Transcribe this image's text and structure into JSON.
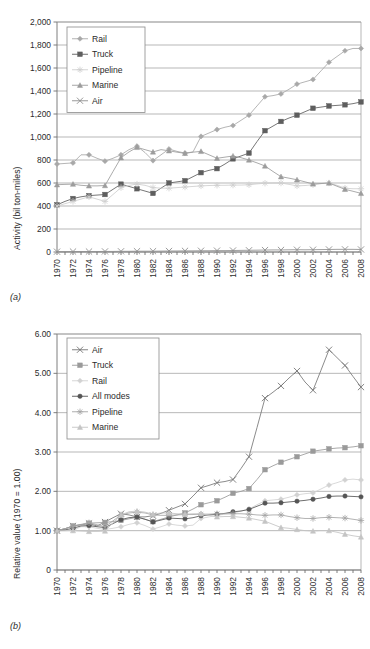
{
  "figure": {
    "panel_a_tag": "(a)",
    "panel_b_tag": "(b)"
  },
  "chart_data": [
    {
      "id": "panel-a",
      "type": "line",
      "title": "",
      "xlabel": "",
      "ylabel": "Activity (bil ton-miles)",
      "panel_label": "(a)",
      "grid": true,
      "legend_position": "top-left",
      "xlim": [
        1970,
        2008
      ],
      "ylim": [
        0,
        2000
      ],
      "yticks": [
        "0",
        "200",
        "400",
        "600",
        "800",
        "1,000",
        "1,200",
        "1,400",
        "1,600",
        "1,800",
        "2,000"
      ],
      "ytick_values": [
        0,
        200,
        400,
        600,
        800,
        1000,
        1200,
        1400,
        1600,
        1800,
        2000
      ],
      "x": [
        1970,
        1971,
        1972,
        1973,
        1974,
        1975,
        1976,
        1977,
        1978,
        1979,
        1980,
        1981,
        1982,
        1983,
        1984,
        1985,
        1986,
        1987,
        1988,
        1989,
        1990,
        1991,
        1992,
        1993,
        1994,
        1995,
        1996,
        1997,
        1998,
        1999,
        2000,
        2001,
        2002,
        2003,
        2004,
        2005,
        2006,
        2007,
        2008
      ],
      "categories": [
        "1970",
        "1972",
        "1974",
        "1976",
        "1978",
        "1980",
        "1982",
        "1984",
        "1986",
        "1988",
        "1990",
        "1992",
        "1994",
        "1996",
        "1998",
        "2000",
        "2002",
        "2004",
        "2006",
        "2008"
      ],
      "series": [
        {
          "name": "Rail",
          "marker": "diamond",
          "color": "#a8a8a8",
          "values": [
            765,
            770,
            775,
            845,
            845,
            815,
            790,
            815,
            845,
            890,
            920,
            865,
            795,
            845,
            895,
            875,
            860,
            870,
            1005,
            1035,
            1065,
            1085,
            1100,
            1145,
            1190,
            1270,
            1350,
            1360,
            1375,
            1415,
            1460,
            1480,
            1500,
            1575,
            1650,
            1700,
            1750,
            1770,
            1770
          ]
        },
        {
          "name": "Truck",
          "marker": "square",
          "color": "#5e5e5e",
          "values": [
            410,
            440,
            465,
            480,
            490,
            495,
            500,
            545,
            590,
            570,
            550,
            530,
            510,
            555,
            600,
            610,
            620,
            655,
            690,
            710,
            725,
            765,
            810,
            835,
            860,
            960,
            1055,
            1095,
            1135,
            1165,
            1190,
            1220,
            1250,
            1260,
            1270,
            1275,
            1280,
            1290,
            1305
          ]
        },
        {
          "name": "Pipeline",
          "marker": "asterisk",
          "color": "#cfcfcf",
          "values": [
            400,
            420,
            440,
            460,
            480,
            460,
            440,
            500,
            560,
            580,
            590,
            580,
            560,
            555,
            555,
            560,
            565,
            570,
            575,
            578,
            580,
            580,
            582,
            582,
            585,
            592,
            598,
            600,
            600,
            588,
            575,
            578,
            585,
            595,
            600,
            580,
            555,
            550,
            550
          ]
        },
        {
          "name": "Marine",
          "marker": "triangle",
          "color": "#9c9c9c",
          "values": [
            585,
            588,
            590,
            580,
            575,
            575,
            578,
            700,
            820,
            870,
            910,
            890,
            870,
            890,
            880,
            868,
            858,
            868,
            875,
            845,
            815,
            825,
            835,
            820,
            800,
            775,
            748,
            700,
            655,
            642,
            628,
            610,
            592,
            595,
            600,
            572,
            545,
            528,
            510
          ]
        },
        {
          "name": "Air",
          "marker": "x",
          "color": "#8f8f8f",
          "values": [
            3,
            3,
            4,
            4,
            4,
            4,
            5,
            5,
            6,
            6,
            7,
            7,
            7,
            8,
            9,
            9,
            10,
            10,
            11,
            11,
            12,
            12,
            13,
            14,
            15,
            16,
            17,
            18,
            18,
            19,
            20,
            19,
            20,
            21,
            22,
            23,
            23,
            23,
            22
          ]
        }
      ]
    },
    {
      "id": "panel-b",
      "type": "line",
      "title": "",
      "xlabel": "",
      "ylabel": "Relative value (1970 = 1.00)",
      "panel_label": "(b)",
      "grid": true,
      "legend_position": "top-left",
      "xlim": [
        1970,
        2008
      ],
      "ylim": [
        0,
        6.0
      ],
      "yticks": [
        "0",
        "1.00",
        "2.00",
        "3.00",
        "4.00",
        "5.00",
        "6.00"
      ],
      "ytick_values": [
        0,
        1,
        2,
        3,
        4,
        5,
        6
      ],
      "x": [
        1970,
        1971,
        1972,
        1973,
        1974,
        1975,
        1976,
        1977,
        1978,
        1979,
        1980,
        1981,
        1982,
        1983,
        1984,
        1985,
        1986,
        1987,
        1988,
        1989,
        1990,
        1991,
        1992,
        1993,
        1994,
        1995,
        1996,
        1997,
        1998,
        1999,
        2000,
        2001,
        2002,
        2003,
        2004,
        2005,
        2006,
        2007,
        2008
      ],
      "categories": [
        "1970",
        "1972",
        "1974",
        "1976",
        "1978",
        "1980",
        "1982",
        "1984",
        "1986",
        "1988",
        "1990",
        "1992",
        "1994",
        "1996",
        "1998",
        "2000",
        "2002",
        "2004",
        "2006",
        "2008"
      ],
      "series": [
        {
          "name": "Air",
          "marker": "x",
          "color": "#767676",
          "values": [
            1.0,
            1.05,
            1.12,
            1.15,
            1.18,
            1.12,
            1.22,
            1.33,
            1.43,
            1.4,
            1.35,
            1.35,
            1.38,
            1.44,
            1.52,
            1.6,
            1.68,
            1.88,
            2.09,
            2.15,
            2.22,
            2.25,
            2.3,
            2.58,
            2.88,
            3.62,
            4.37,
            4.52,
            4.68,
            4.88,
            5.06,
            4.78,
            4.57,
            5.08,
            5.6,
            5.4,
            5.2,
            4.92,
            4.65
          ]
        },
        {
          "name": "Truck",
          "marker": "square",
          "color": "#9a9a9a",
          "values": [
            1.0,
            1.05,
            1.12,
            1.16,
            1.19,
            1.2,
            1.21,
            1.23,
            1.26,
            1.3,
            1.34,
            1.29,
            1.23,
            1.29,
            1.35,
            1.4,
            1.45,
            1.55,
            1.66,
            1.71,
            1.76,
            1.85,
            1.95,
            2.0,
            2.07,
            2.3,
            2.55,
            2.65,
            2.74,
            2.81,
            2.88,
            2.95,
            3.02,
            3.05,
            3.08,
            3.1,
            3.11,
            3.13,
            3.16
          ]
        },
        {
          "name": "Rail",
          "marker": "diamond",
          "color": "#d2d2d2",
          "values": [
            1.0,
            1.0,
            1.01,
            1.1,
            1.1,
            1.06,
            1.03,
            1.06,
            1.1,
            1.16,
            1.2,
            1.13,
            1.04,
            1.1,
            1.17,
            1.14,
            1.12,
            1.14,
            1.31,
            1.35,
            1.39,
            1.42,
            1.44,
            1.5,
            1.55,
            1.66,
            1.76,
            1.78,
            1.8,
            1.85,
            1.91,
            1.94,
            1.96,
            2.06,
            2.16,
            2.22,
            2.29,
            2.31,
            2.29
          ]
        },
        {
          "name": "All modes",
          "marker": "circle",
          "color": "#555555",
          "values": [
            1.0,
            1.02,
            1.06,
            1.12,
            1.13,
            1.1,
            1.08,
            1.18,
            1.28,
            1.33,
            1.35,
            1.29,
            1.22,
            1.27,
            1.32,
            1.31,
            1.3,
            1.33,
            1.38,
            1.4,
            1.42,
            1.44,
            1.48,
            1.5,
            1.54,
            1.62,
            1.7,
            1.7,
            1.71,
            1.73,
            1.75,
            1.77,
            1.8,
            1.83,
            1.87,
            1.88,
            1.88,
            1.87,
            1.86
          ]
        },
        {
          "name": "Pipeline",
          "marker": "asterisk",
          "color": "#a5a5a5",
          "values": [
            1.0,
            1.05,
            1.1,
            1.15,
            1.2,
            1.15,
            1.1,
            1.25,
            1.4,
            1.45,
            1.47,
            1.45,
            1.4,
            1.39,
            1.39,
            1.4,
            1.41,
            1.41,
            1.42,
            1.42,
            1.43,
            1.43,
            1.43,
            1.43,
            1.42,
            1.4,
            1.39,
            1.4,
            1.4,
            1.36,
            1.33,
            1.31,
            1.31,
            1.33,
            1.34,
            1.33,
            1.32,
            1.29,
            1.26
          ]
        },
        {
          "name": "Marine",
          "marker": "triangle",
          "color": "#c4c4c4",
          "values": [
            1.0,
            1.0,
            1.0,
            0.99,
            0.98,
            0.98,
            0.99,
            1.2,
            1.4,
            1.48,
            1.5,
            1.47,
            1.42,
            1.45,
            1.45,
            1.43,
            1.42,
            1.43,
            1.43,
            1.39,
            1.35,
            1.36,
            1.36,
            1.34,
            1.32,
            1.28,
            1.24,
            1.16,
            1.08,
            1.06,
            1.03,
            1.0,
            0.99,
            1.0,
            1.0,
            0.96,
            0.91,
            0.87,
            0.84
          ]
        }
      ]
    }
  ]
}
